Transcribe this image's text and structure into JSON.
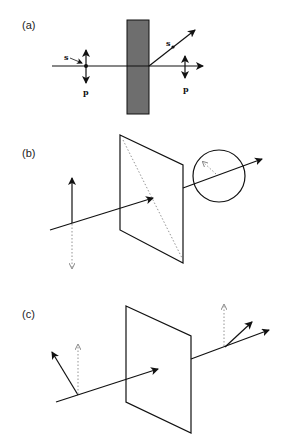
{
  "figure": {
    "panels": [
      {
        "id": "a",
        "label": "(a)",
        "elements": {
          "incident_s_label": "s",
          "incident_p_label": "p",
          "reflected_s_label": "s",
          "transmitted_p_label": "p",
          "plate_color": "#6e6e6e"
        }
      },
      {
        "id": "b",
        "label": "(b)"
      },
      {
        "id": "c",
        "label": "(c)"
      }
    ],
    "colors": {
      "stroke": "#111111",
      "dotted": "#888888",
      "background": "#ffffff"
    }
  }
}
